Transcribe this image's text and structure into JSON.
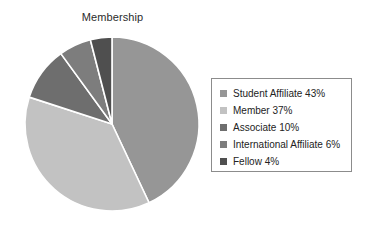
{
  "chart_data": {
    "type": "pie",
    "title": "Membership",
    "xlabel": "",
    "ylabel": "",
    "legend_position": "right",
    "grid": false,
    "start_angle_deg": 0,
    "direction": "clockwise",
    "categories": [
      "Student Affiliate",
      "Member",
      "Associate",
      "International Affiliate",
      "Fellow"
    ],
    "values": [
      43,
      37,
      10,
      6,
      4
    ],
    "value_unit": "%",
    "colors": [
      "#969696",
      "#c2c2c2",
      "#6e6e6e",
      "#7d7d7d",
      "#4f4f4f"
    ],
    "slices": [
      {
        "label": "Student Affiliate",
        "value": 43,
        "display": "Student Affiliate 43%",
        "color": "#969696"
      },
      {
        "label": "Member",
        "value": 37,
        "display": "Member 37%",
        "color": "#c2c2c2"
      },
      {
        "label": "Associate",
        "value": 10,
        "display": "Associate 10%",
        "color": "#6e6e6e"
      },
      {
        "label": "International Affiliate",
        "value": 6,
        "display": "International Affiliate 6%",
        "color": "#7d7d7d"
      },
      {
        "label": "Fellow",
        "value": 4,
        "display": "Fellow 4%",
        "color": "#4f4f4f"
      }
    ]
  },
  "legend": {
    "items": [
      {
        "text": "Student Affiliate 43%",
        "color": "#969696"
      },
      {
        "text": "Member 37%",
        "color": "#c2c2c2"
      },
      {
        "text": "Associate 10%",
        "color": "#6e6e6e"
      },
      {
        "text": "International Affiliate 6%",
        "color": "#7d7d7d"
      },
      {
        "text": "Fellow 4%",
        "color": "#4f4f4f"
      }
    ]
  },
  "style": {
    "slice_separator_color": "#ffffff",
    "legend_border_color": "#8c8c8c",
    "background": "#ffffff",
    "title_color": "#2b2b2b"
  }
}
